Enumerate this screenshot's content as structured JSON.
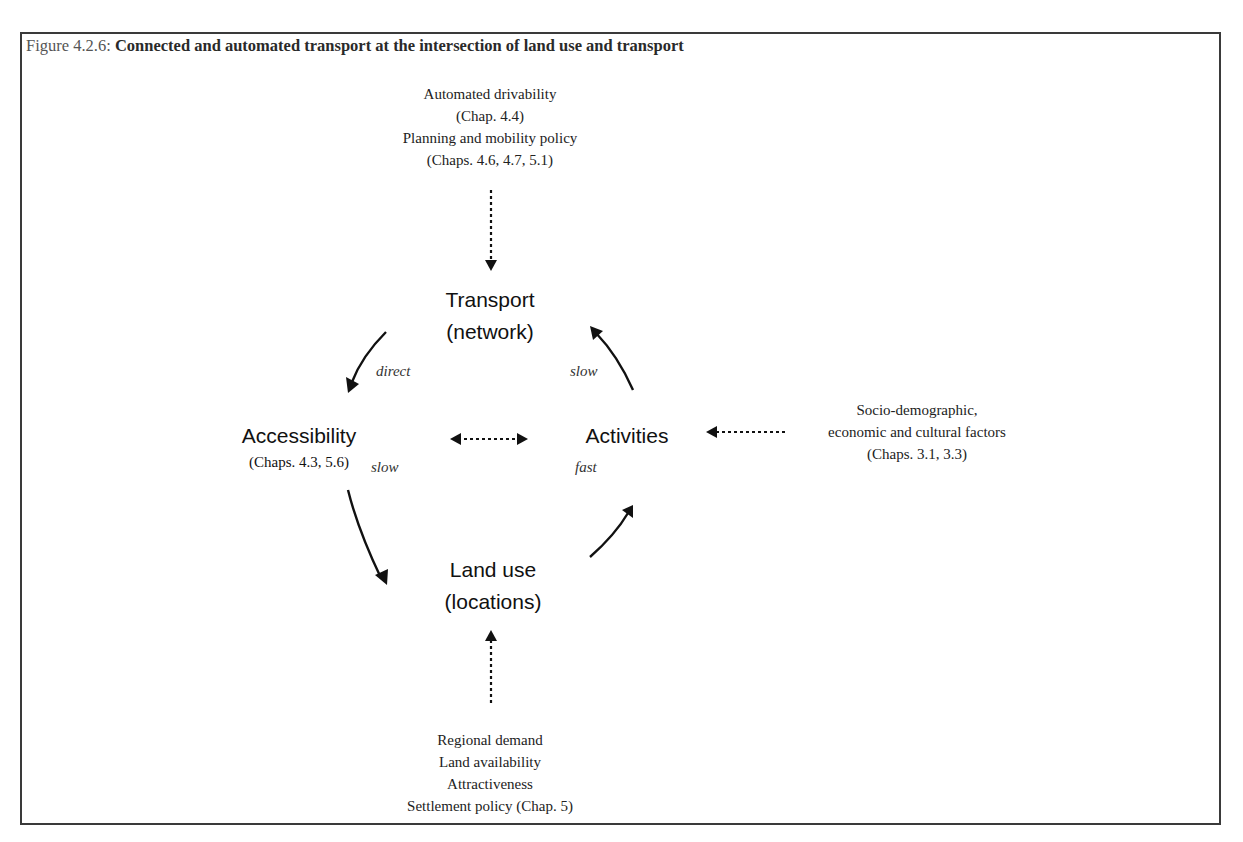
{
  "figure": {
    "number_label": "Figure 4.2.6:",
    "title": "Connected and automated transport at the intersection of land use and transport"
  },
  "nodes": {
    "transport": {
      "line1": "Transport",
      "line2": "(network)"
    },
    "accessibility": {
      "line1": "Accessibility",
      "reference": "(Chaps. 4.3, 5.6)"
    },
    "activities": {
      "line1": "Activities"
    },
    "land_use": {
      "line1": "Land use",
      "line2": "(locations)"
    }
  },
  "edges": {
    "transport_to_accessibility": {
      "label": "direct"
    },
    "activities_to_transport": {
      "label": "slow"
    },
    "accessibility_to_land_use": {
      "label": "slow"
    },
    "land_use_to_activities": {
      "label": "fast"
    }
  },
  "external_factors": {
    "top": {
      "lines": [
        "Automated drivability",
        "(Chap. 4.4)",
        "Planning and mobility policy",
        "(Chaps. 4.6, 4.7, 5.1)"
      ]
    },
    "right": {
      "lines": [
        "Socio-demographic,",
        "economic and cultural factors",
        "(Chaps. 3.1, 3.3)"
      ]
    },
    "bottom": {
      "lines": [
        "Regional demand",
        "Land availability",
        "Attractiveness",
        "Settlement policy (Chap. 5)"
      ]
    }
  },
  "colors": {
    "frame_border": "#3a3a3a",
    "arrow": "#111111",
    "text": "#222222"
  }
}
